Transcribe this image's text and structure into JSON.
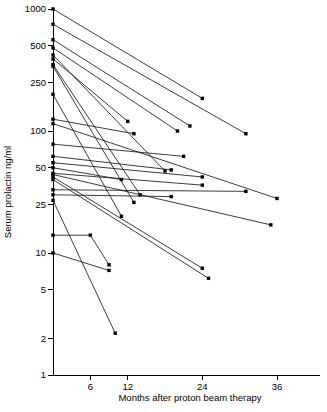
{
  "chart_data": {
    "type": "line",
    "title": "",
    "xlabel": "Months after proton beam therapy",
    "ylabel": "Serum prolactin ng/ml",
    "yscale": "log",
    "ylim": [
      1,
      1000
    ],
    "xlim": [
      0,
      40
    ],
    "grid": false,
    "legend": "none",
    "marker": "filled-square",
    "y_ticks": [
      1,
      2,
      5,
      10,
      25,
      50,
      100,
      250,
      500,
      1000
    ],
    "y_tick_labels": [
      "1",
      "2",
      "5",
      "10",
      "25",
      "50",
      "100",
      "250",
      "500",
      "1000"
    ],
    "x_ticks": [
      6,
      12,
      24,
      36
    ],
    "x_tick_labels": [
      "6",
      "12",
      "24",
      "36"
    ],
    "series": [
      {
        "name": "patient-01",
        "x": [
          0,
          24
        ],
        "y": [
          1000,
          185
        ]
      },
      {
        "name": "patient-02",
        "x": [
          0,
          31
        ],
        "y": [
          750,
          95
        ]
      },
      {
        "name": "patient-03",
        "x": [
          0,
          22
        ],
        "y": [
          560,
          110
        ]
      },
      {
        "name": "patient-04",
        "x": [
          0,
          20
        ],
        "y": [
          480,
          100
        ]
      },
      {
        "name": "patient-05",
        "x": [
          0,
          18
        ],
        "y": [
          420,
          47
        ]
      },
      {
        "name": "patient-06",
        "x": [
          0,
          12
        ],
        "y": [
          390,
          120
        ]
      },
      {
        "name": "patient-07",
        "x": [
          0,
          14
        ],
        "y": [
          350,
          30
        ]
      },
      {
        "name": "patient-08",
        "x": [
          0,
          13
        ],
        "y": [
          340,
          26
        ]
      },
      {
        "name": "patient-09",
        "x": [
          0,
          11
        ],
        "y": [
          200,
          20
        ]
      },
      {
        "name": "patient-10",
        "x": [
          0,
          13
        ],
        "y": [
          125,
          95
        ]
      },
      {
        "name": "patient-11",
        "x": [
          0,
          36
        ],
        "y": [
          115,
          28
        ]
      },
      {
        "name": "patient-12",
        "x": [
          0,
          21
        ],
        "y": [
          78,
          62
        ]
      },
      {
        "name": "patient-13",
        "x": [
          0,
          19
        ],
        "y": [
          62,
          48
        ]
      },
      {
        "name": "patient-14",
        "x": [
          0,
          24
        ],
        "y": [
          55,
          42
        ]
      },
      {
        "name": "patient-15",
        "x": [
          0,
          11
        ],
        "y": [
          50,
          40
        ]
      },
      {
        "name": "patient-16",
        "x": [
          0,
          24
        ],
        "y": [
          45,
          36
        ]
      },
      {
        "name": "patient-17",
        "x": [
          0,
          35
        ],
        "y": [
          44,
          17
        ]
      },
      {
        "name": "patient-18",
        "x": [
          0,
          24
        ],
        "y": [
          42,
          7.5
        ]
      },
      {
        "name": "patient-19",
        "x": [
          0,
          25
        ],
        "y": [
          40,
          6.2
        ]
      },
      {
        "name": "patient-20",
        "x": [
          0,
          31
        ],
        "y": [
          33,
          32
        ]
      },
      {
        "name": "patient-21",
        "x": [
          0,
          19
        ],
        "y": [
          30,
          29
        ]
      },
      {
        "name": "patient-22",
        "x": [
          0,
          10
        ],
        "y": [
          27,
          2.2
        ]
      },
      {
        "name": "patient-23",
        "x": [
          0,
          6,
          9
        ],
        "y": [
          14,
          14,
          8.0
        ]
      },
      {
        "name": "patient-24",
        "x": [
          0,
          9
        ],
        "y": [
          10,
          7.2
        ]
      }
    ]
  }
}
